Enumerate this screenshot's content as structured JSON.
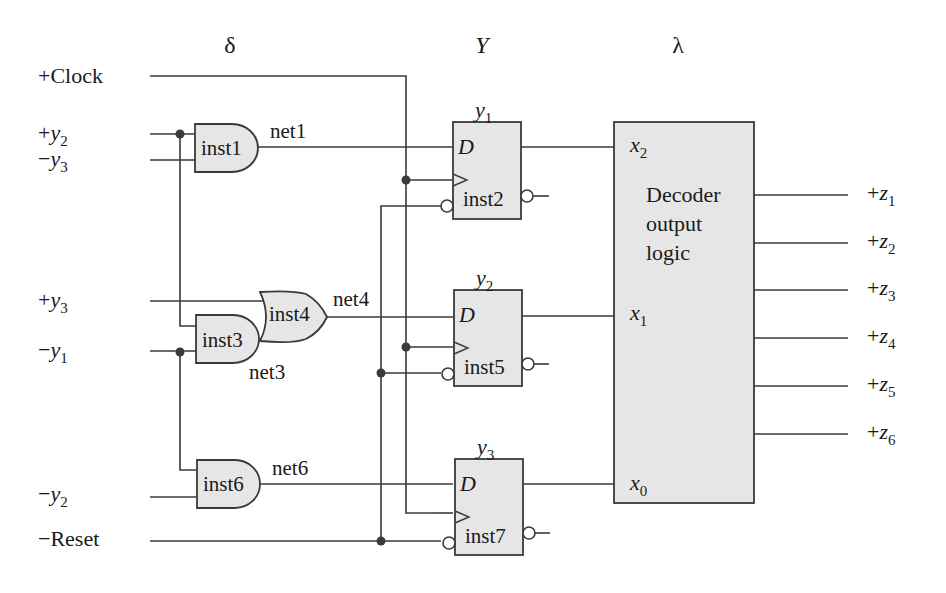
{
  "headers": {
    "delta": "δ",
    "Y": "Y",
    "lambda": "λ"
  },
  "inputs": {
    "clock": {
      "sign": "+",
      "name": "Clock"
    },
    "y2_pos": {
      "sign": "+",
      "var": "y",
      "sub": "2"
    },
    "y3_neg": {
      "sign": "−",
      "var": "y",
      "sub": "3"
    },
    "y3_pos": {
      "sign": "+",
      "var": "y",
      "sub": "3"
    },
    "y1_neg": {
      "sign": "−",
      "var": "y",
      "sub": "1"
    },
    "y2_neg": {
      "sign": "−",
      "var": "y",
      "sub": "2"
    },
    "reset": {
      "sign": "−",
      "name": "Reset"
    }
  },
  "gates": {
    "inst1": {
      "label": "inst1",
      "type": "AND"
    },
    "inst3": {
      "label": "inst3",
      "type": "AND"
    },
    "inst4": {
      "label": "inst4",
      "type": "OR"
    },
    "inst6": {
      "label": "inst6",
      "type": "AND"
    }
  },
  "nets": {
    "net1": "net1",
    "net3": "net3",
    "net4": "net4",
    "net6": "net6"
  },
  "flipflops": [
    {
      "label": "inst2",
      "state_var": "y",
      "state_sub": "1",
      "d_label": "D"
    },
    {
      "label": "inst5",
      "state_var": "y",
      "state_sub": "2",
      "d_label": "D"
    },
    {
      "label": "inst7",
      "state_var": "y",
      "state_sub": "3",
      "d_label": "D"
    }
  ],
  "decoder": {
    "title_lines": [
      "Decoder",
      "output",
      "logic"
    ],
    "inputs": [
      {
        "var": "x",
        "sub": "2"
      },
      {
        "var": "x",
        "sub": "1"
      },
      {
        "var": "x",
        "sub": "0"
      }
    ]
  },
  "outputs": [
    {
      "sign": "+",
      "var": "z",
      "sub": "1"
    },
    {
      "sign": "+",
      "var": "z",
      "sub": "2"
    },
    {
      "sign": "+",
      "var": "z",
      "sub": "3"
    },
    {
      "sign": "+",
      "var": "z",
      "sub": "4"
    },
    {
      "sign": "+",
      "var": "z",
      "sub": "5"
    },
    {
      "sign": "+",
      "var": "z",
      "sub": "6"
    }
  ]
}
